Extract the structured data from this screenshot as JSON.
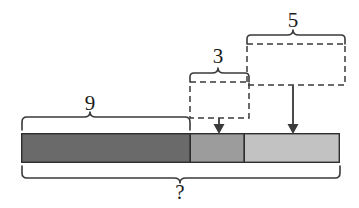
{
  "diagram": {
    "type": "tape-diagram",
    "title": "",
    "bar": {
      "x": 21,
      "y": 133,
      "width": 319,
      "height": 30,
      "segments": [
        {
          "name": "left-segment",
          "label": "9",
          "start": 21,
          "end": 190,
          "color": "#6a6a6a"
        },
        {
          "name": "middle-segment",
          "label": "3",
          "start": 190,
          "end": 244,
          "color": "#9c9c9c"
        },
        {
          "name": "right-segment",
          "label": "5",
          "start": 244,
          "end": 340,
          "color": "#c2c2c2"
        }
      ]
    },
    "labels": {
      "nine": "9",
      "three": "3",
      "five": "5",
      "question": "?"
    },
    "braces": [
      {
        "name": "brace-nine",
        "label": "9",
        "start": 21,
        "end": 190,
        "orientation": "up",
        "span_label_x": 90,
        "span_label_y": 105
      },
      {
        "name": "brace-three",
        "label": "3",
        "start": 190,
        "end": 249,
        "orientation": "up",
        "span_label_x": 218,
        "span_label_y": 58
      },
      {
        "name": "brace-five",
        "label": "5",
        "start": 247,
        "end": 345,
        "orientation": "up",
        "span_label_x": 293,
        "span_label_y": 22
      },
      {
        "name": "brace-question",
        "label": "?",
        "start": 21,
        "end": 340,
        "orientation": "down",
        "span_label_x": 180,
        "span_label_y": 192
      }
    ],
    "dashed_boxes": [
      {
        "name": "dashed-box-three",
        "x": 190,
        "y": 82,
        "width": 59,
        "height": 36
      },
      {
        "name": "dashed-box-five",
        "x": 247,
        "y": 44,
        "width": 98,
        "height": 41
      }
    ],
    "arrows": [
      {
        "name": "arrow-three",
        "x": 219,
        "from_y": 118,
        "to_y": 133
      },
      {
        "name": "arrow-five",
        "x": 293,
        "from_y": 85,
        "to_y": 133
      }
    ],
    "colors": {
      "dark_gray": "#6a6a6a",
      "medium_gray": "#9c9c9c",
      "light_gray": "#c2c2c2",
      "stroke": "#3a3a3a",
      "background": "#ffffff"
    }
  }
}
